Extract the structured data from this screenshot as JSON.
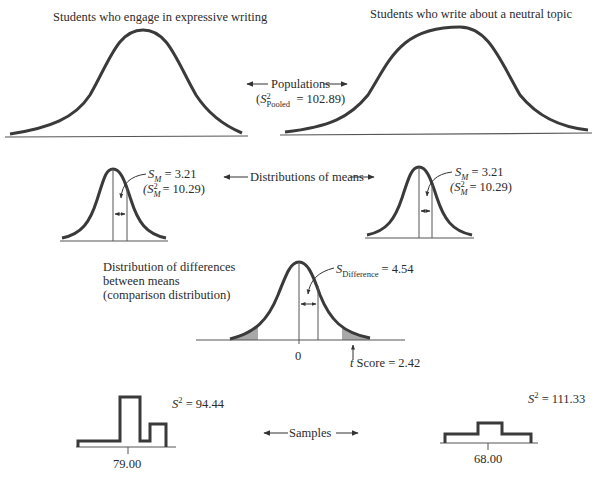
{
  "populations": {
    "left_title": "Students who engage in expressive writing",
    "right_title": "Students who write about a neutral topic",
    "center_label": "Populations",
    "pooled_variance_symbol": "S",
    "pooled_variance_sup": "2",
    "pooled_variance_sub": "Pooled",
    "pooled_variance_value": "= 102.89)"
  },
  "means": {
    "center_label": "Distributions of means",
    "left": {
      "sm_symbol": "S",
      "sm_sub": "M",
      "sm_value": "= 3.21",
      "var_symbol": "(S",
      "var_sup": "2",
      "var_sub": "M",
      "var_value": "= 10.29)"
    },
    "right": {
      "sm_symbol": "S",
      "sm_sub": "M",
      "sm_value": "= 3.21",
      "var_symbol": "(S",
      "var_sup": "2",
      "var_sub": "M",
      "var_value": "= 10.29)"
    }
  },
  "difference": {
    "title_lines": [
      "Distribution of differences",
      "between means",
      "(comparison distribution)"
    ],
    "sd_symbol": "S",
    "sd_sub": "Difference",
    "sd_value": "= 4.54",
    "zero_tick": "0",
    "t_prefix": "t",
    "t_label": "Score = 2.42"
  },
  "samples": {
    "center_label": "Samples",
    "left": {
      "variance_symbol": "S",
      "variance_sup": "2",
      "variance_value": "= 94.44",
      "mean": "79.00"
    },
    "right": {
      "variance_symbol": "S",
      "variance_sup": "2",
      "variance_value": "= 111.33",
      "mean": "68.00"
    }
  },
  "colors": {
    "curve": "#3a3a3a",
    "line": "#555555",
    "shade": "#a8a8a8"
  }
}
